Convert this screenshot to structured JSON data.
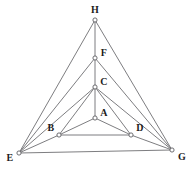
{
  "figure": {
    "title": "",
    "background_color": "#ffffff",
    "edge_color": "#6e6e72",
    "vertex_fill_color": "#ffffff",
    "vertex_stroke_color": "#5d5d62",
    "label_color": "#1c1c1c"
  },
  "graph": {
    "type": "node-link-diagram",
    "vertex_count": 8,
    "edge_count": 15,
    "vertices": [
      {
        "id": "A",
        "label": "A",
        "x": 95,
        "y": 118,
        "label_x": 104,
        "label_y": 113
      },
      {
        "id": "B",
        "label": "B",
        "x": 59,
        "y": 135,
        "label_x": 51,
        "label_y": 128
      },
      {
        "id": "C",
        "label": "C",
        "x": 95,
        "y": 87,
        "label_x": 104,
        "label_y": 82
      },
      {
        "id": "D",
        "label": "D",
        "x": 131,
        "y": 135,
        "label_x": 140,
        "label_y": 128
      },
      {
        "id": "E",
        "label": "E",
        "x": 19,
        "y": 153,
        "label_x": 10,
        "label_y": 158
      },
      {
        "id": "F",
        "label": "F",
        "x": 95,
        "y": 58,
        "label_x": 104,
        "label_y": 53
      },
      {
        "id": "G",
        "label": "G",
        "x": 172,
        "y": 150,
        "label_x": 182,
        "label_y": 157
      },
      {
        "id": "H",
        "label": "H",
        "x": 95,
        "y": 20,
        "label_x": 95,
        "label_y": 10
      }
    ],
    "edges": [
      {
        "from": "A",
        "to": "B"
      },
      {
        "from": "A",
        "to": "C"
      },
      {
        "from": "A",
        "to": "D"
      },
      {
        "from": "B",
        "to": "C"
      },
      {
        "from": "B",
        "to": "D"
      },
      {
        "from": "B",
        "to": "E"
      },
      {
        "from": "C",
        "to": "D"
      },
      {
        "from": "C",
        "to": "E"
      },
      {
        "from": "C",
        "to": "G"
      },
      {
        "from": "C",
        "to": "F"
      },
      {
        "from": "D",
        "to": "G"
      },
      {
        "from": "E",
        "to": "F"
      },
      {
        "from": "E",
        "to": "G"
      },
      {
        "from": "E",
        "to": "H"
      },
      {
        "from": "F",
        "to": "G"
      },
      {
        "from": "F",
        "to": "H"
      },
      {
        "from": "G",
        "to": "H"
      }
    ]
  }
}
